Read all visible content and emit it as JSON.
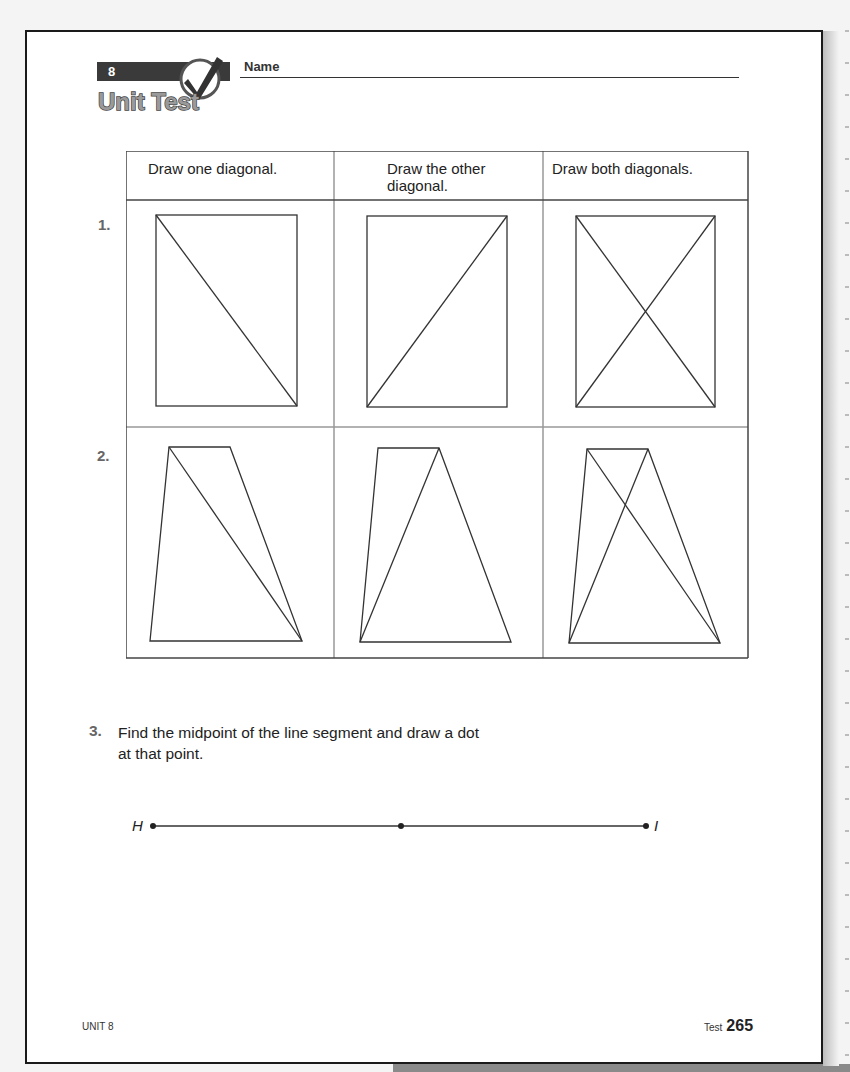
{
  "header": {
    "unit_number": "8",
    "logo_text": "Unit Test",
    "name_label": "Name"
  },
  "table": {
    "columns": [
      {
        "label_line1": "Draw one diagonal.",
        "label_line2": ""
      },
      {
        "label_line1": "Draw the other",
        "label_line2": "diagonal."
      },
      {
        "label_line1": "Draw both diagonals.",
        "label_line2": ""
      }
    ],
    "rows": [
      {
        "number": "1.",
        "shape": "rectangle",
        "diagonals_drawn": [
          "one",
          "other",
          "both"
        ]
      },
      {
        "number": "2.",
        "shape": "trapezoid",
        "diagonals_drawn": [
          "one",
          "other",
          "both"
        ]
      }
    ]
  },
  "question3": {
    "number": "3.",
    "text_line1": "Find the midpoint of the line segment and draw a dot",
    "text_line2": "at that point.",
    "segment": {
      "start_label": "H",
      "end_label": "I",
      "midpoint_marked": true
    }
  },
  "footer": {
    "unit": "UNIT 8",
    "test_label": "Test",
    "page_number": "265"
  },
  "colors": {
    "ink": "#222222",
    "grid_line": "#999999",
    "number_grey": "#666666",
    "banner_dark": "#3a3a3a"
  }
}
